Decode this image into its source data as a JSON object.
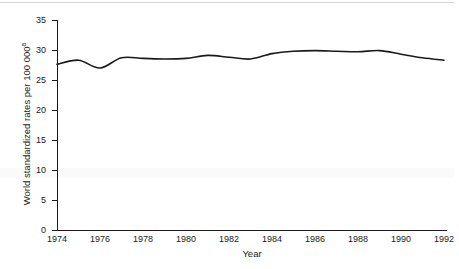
{
  "chart_data": {
    "type": "line",
    "title": "",
    "xlabel": "Year",
    "ylabel": "World standardized rates per 100 000",
    "ylabel_superscript": "a",
    "xlim": [
      1974,
      1992
    ],
    "ylim": [
      0,
      35
    ],
    "ytick_step": 5,
    "xtick_step": 2,
    "grid": false,
    "legend": null,
    "line_color": "#1a1a1a",
    "x": [
      1974,
      1975,
      1976,
      1977,
      1978,
      1979,
      1980,
      1981,
      1982,
      1983,
      1984,
      1985,
      1986,
      1987,
      1988,
      1989,
      1990,
      1991,
      1992
    ],
    "values": [
      27.6,
      28.3,
      27.0,
      28.7,
      28.6,
      28.5,
      28.6,
      29.1,
      28.8,
      28.5,
      29.4,
      29.8,
      29.9,
      29.8,
      29.7,
      29.9,
      29.3,
      28.7,
      28.3
    ],
    "xticks": [
      1974,
      1976,
      1978,
      1980,
      1982,
      1984,
      1986,
      1988,
      1990,
      1992
    ],
    "xtick_labels": [
      "1974",
      "1976",
      "1978",
      "1980",
      "1982",
      "1984",
      "1986",
      "1988",
      "1990",
      "1992"
    ],
    "yticks": [
      0,
      5,
      10,
      15,
      20,
      25,
      30,
      35
    ],
    "ytick_labels": [
      "0",
      "5",
      "10",
      "15",
      "20",
      "25",
      "30",
      "35"
    ]
  }
}
